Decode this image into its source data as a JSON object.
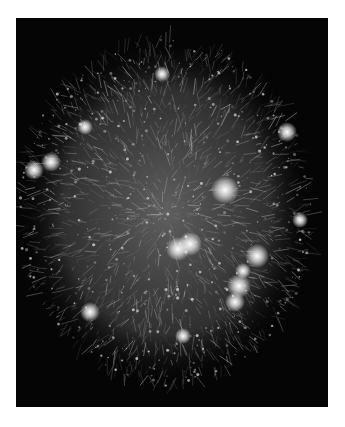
{
  "image": {
    "description": "Network graph visualization — dense glowing web of nodes and links on black background",
    "background_color": "#050505",
    "frame_color": "#ffffff",
    "cloud": {
      "cx": 166,
      "cy": 212,
      "rx": 148,
      "ry": 175,
      "color": "#bfbfbf"
    },
    "bright_nodes": [
      {
        "x": 178,
        "y": 249,
        "r": 6
      },
      {
        "x": 190,
        "y": 244,
        "r": 6
      },
      {
        "x": 257,
        "y": 256,
        "r": 6
      },
      {
        "x": 239,
        "y": 286,
        "r": 6
      },
      {
        "x": 235,
        "y": 302,
        "r": 5
      },
      {
        "x": 225,
        "y": 190,
        "r": 7
      },
      {
        "x": 34,
        "y": 170,
        "r": 5
      },
      {
        "x": 51,
        "y": 162,
        "r": 5
      },
      {
        "x": 287,
        "y": 132,
        "r": 5
      },
      {
        "x": 162,
        "y": 74,
        "r": 4
      },
      {
        "x": 85,
        "y": 127,
        "r": 4
      },
      {
        "x": 300,
        "y": 220,
        "r": 4
      },
      {
        "x": 90,
        "y": 312,
        "r": 5
      },
      {
        "x": 183,
        "y": 336,
        "r": 4
      },
      {
        "x": 243,
        "y": 271,
        "r": 4
      }
    ]
  }
}
